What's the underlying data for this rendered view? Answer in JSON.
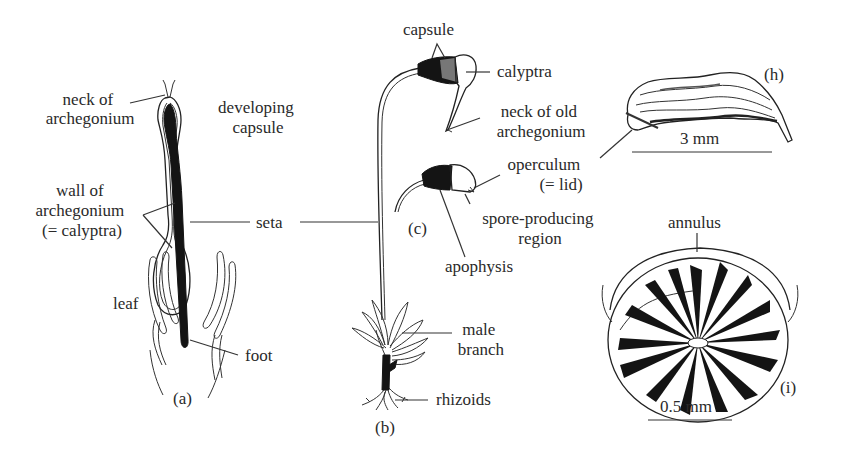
{
  "figure": {
    "panels": [
      {
        "id": "a",
        "label": "(a)"
      },
      {
        "id": "b",
        "label": "(b)"
      },
      {
        "id": "c",
        "label": "(c)"
      },
      {
        "id": "h",
        "label": "(h)"
      },
      {
        "id": "i",
        "label": "(i)"
      }
    ],
    "labels": {
      "neck_of_archegonium": [
        "neck of",
        "archegonium"
      ],
      "developing_capsule": [
        "developing",
        "capsule"
      ],
      "wall_of_archegonium": [
        "wall of",
        "archegonium",
        "(= calyptra)"
      ],
      "seta": "seta",
      "leaf": "leaf",
      "foot": "foot",
      "capsule": "capsule",
      "calyptra": "calyptra",
      "neck_of_old_archegonium": [
        "neck of old",
        "archegonium"
      ],
      "operculum": [
        "operculum",
        "(= lid)"
      ],
      "spore_producing_region": [
        "spore-producing",
        "region"
      ],
      "apophysis": "apophysis",
      "male_branch": [
        "male",
        "branch"
      ],
      "rhizoids": "rhizoids",
      "annulus": "annulus"
    },
    "scale_bars": {
      "h": "3 mm",
      "i": "0.5 mm"
    }
  }
}
